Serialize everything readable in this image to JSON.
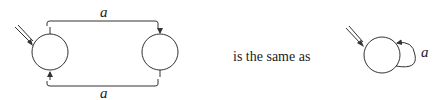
{
  "diagram": {
    "left": {
      "states": [
        {
          "id": "s0",
          "start": true
        },
        {
          "id": "s1",
          "start": false
        }
      ],
      "edges": [
        {
          "from": "s0",
          "to": "s1",
          "label": "a",
          "position": "top"
        },
        {
          "from": "s1",
          "to": "s0",
          "label": "a",
          "position": "bottom"
        }
      ]
    },
    "connector_text": "is the same as",
    "right": {
      "states": [
        {
          "id": "q0",
          "start": true
        }
      ],
      "edges": [
        {
          "from": "q0",
          "to": "q0",
          "label": "a",
          "position": "self-loop-right"
        }
      ]
    },
    "colors": {
      "stroke": "#333333",
      "background": "#ffffff"
    }
  }
}
